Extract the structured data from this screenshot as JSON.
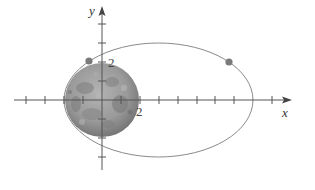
{
  "diagram": {
    "type": "orbit-diagram",
    "axes": {
      "x_label": "x",
      "y_label": "y",
      "origin_px": [
        102,
        100
      ],
      "unit_px": 19,
      "x_ticks": [
        -4,
        -3,
        -2,
        -1,
        1,
        2,
        3,
        4,
        5,
        6,
        7,
        8,
        9,
        10
      ],
      "y_ticks": [
        -3,
        -2,
        -1,
        1,
        2,
        3,
        4
      ],
      "x_tick_label": "2",
      "y_tick_label": "2"
    },
    "moon": {
      "name": "moon",
      "center": [
        0,
        0
      ],
      "radius_units": 1.95
    },
    "orbit": {
      "shape": "ellipse",
      "center_units": [
        2.95,
        0
      ],
      "semi_major_units": 4.97,
      "semi_minor_units": 3.0
    },
    "points": [
      {
        "name": "satellite-position-1",
        "x_units": -0.68,
        "y_units": 2.05
      },
      {
        "name": "satellite-position-2",
        "x_units": 6.68,
        "y_units": 2.0
      }
    ],
    "colors": {
      "axis": "#555555",
      "orbit": "#8a8a8a",
      "point": "#7a7a7a",
      "moon_base": "#9c9c9c"
    }
  }
}
